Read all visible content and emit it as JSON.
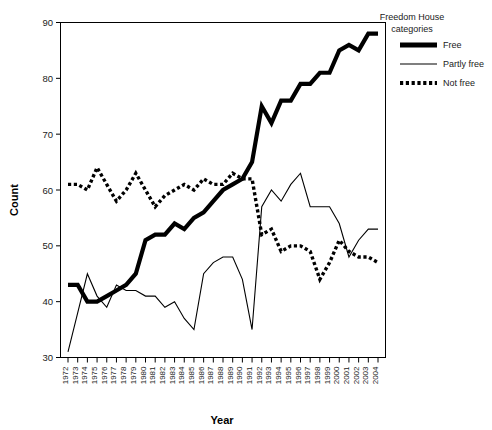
{
  "chart_data": {
    "type": "line",
    "title": "",
    "xlabel": "Year",
    "ylabel": "Count",
    "xlim": [
      1972,
      2004
    ],
    "ylim": [
      30,
      90
    ],
    "yticks": [
      30,
      40,
      50,
      60,
      70,
      80,
      90
    ],
    "grid": false,
    "legend_position": "right-top",
    "legend_title_line1": "Freedom House",
    "legend_title_line2": "categories",
    "x": [
      1972,
      1973,
      1974,
      1975,
      1976,
      1977,
      1978,
      1979,
      1980,
      1981,
      1982,
      1983,
      1984,
      1985,
      1986,
      1987,
      1988,
      1989,
      1990,
      1991,
      1992,
      1993,
      1994,
      1995,
      1996,
      1997,
      1998,
      1999,
      2000,
      2001,
      2002,
      2003,
      2004
    ],
    "xtick_labels": [
      "1972",
      "1973",
      "1974",
      "1975",
      "1976",
      "1977",
      "1978",
      "1979",
      "1980",
      "1981",
      "1982",
      "1983",
      "1984",
      "1985",
      "1986",
      "1987",
      "1988",
      "1989",
      "1990",
      "1991",
      "1992",
      "1993",
      "1994",
      "1995",
      "1996",
      "1997",
      "1998",
      "1999",
      "2000",
      "2001",
      "2002",
      "2003",
      "2004"
    ],
    "series": [
      {
        "name": "Free",
        "style": "thick-solid",
        "values": [
          43,
          43,
          40,
          40,
          41,
          42,
          43,
          45,
          51,
          52,
          52,
          54,
          53,
          55,
          56,
          58,
          60,
          61,
          62,
          65,
          75,
          72,
          76,
          76,
          79,
          79,
          81,
          81,
          85,
          86,
          85,
          88,
          88
        ]
      },
      {
        "name": "Partly free",
        "style": "thin-solid",
        "values": [
          31,
          38,
          45,
          41,
          39,
          43,
          42,
          42,
          41,
          41,
          39,
          40,
          37,
          35,
          45,
          47,
          48,
          48,
          44,
          35,
          57,
          60,
          58,
          61,
          63,
          57,
          57,
          57,
          54,
          48,
          51,
          53,
          53
        ]
      },
      {
        "name": "Not free",
        "style": "dotted",
        "values": [
          61,
          61,
          60,
          64,
          61,
          58,
          60,
          63,
          60,
          57,
          59,
          60,
          61,
          60,
          62,
          61,
          61,
          63,
          62,
          62,
          52,
          53,
          49,
          50,
          50,
          49,
          44,
          47,
          51,
          49,
          48,
          48,
          47
        ]
      }
    ]
  },
  "legend": {
    "items": [
      {
        "label": "Free",
        "icon": "thick-line-swatch"
      },
      {
        "label": "Partly free",
        "icon": "thin-line-swatch"
      },
      {
        "label": "Not free",
        "icon": "dotted-line-swatch"
      }
    ]
  }
}
